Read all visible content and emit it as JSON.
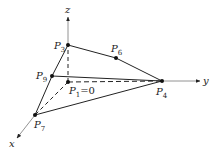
{
  "diagram": {
    "type": "3d-coordinate-polyhedron",
    "axes": {
      "x": {
        "label": "x"
      },
      "y": {
        "label": "y"
      },
      "z": {
        "label": "z"
      }
    },
    "points": {
      "P1": {
        "name": "P",
        "sub": "1",
        "suffix": "=0"
      },
      "P3": {
        "name": "P",
        "sub": "3"
      },
      "P4": {
        "name": "P",
        "sub": "4"
      },
      "P6": {
        "name": "P",
        "sub": "6"
      },
      "P7": {
        "name": "P",
        "sub": "7"
      },
      "P9": {
        "name": "P",
        "sub": "9"
      }
    },
    "solid_edges": [
      [
        "P3",
        "P6"
      ],
      [
        "P6",
        "P4"
      ],
      [
        "P3",
        "P9"
      ],
      [
        "P9",
        "P7"
      ],
      [
        "P9",
        "P4"
      ],
      [
        "P7",
        "P4"
      ]
    ],
    "dashed_edges": [
      [
        "P1",
        "P3"
      ],
      [
        "P1",
        "P4"
      ],
      [
        "P1",
        "P7"
      ]
    ],
    "colors": {
      "line": "#222222",
      "axis": "#555555",
      "background": "#ffffff"
    }
  }
}
